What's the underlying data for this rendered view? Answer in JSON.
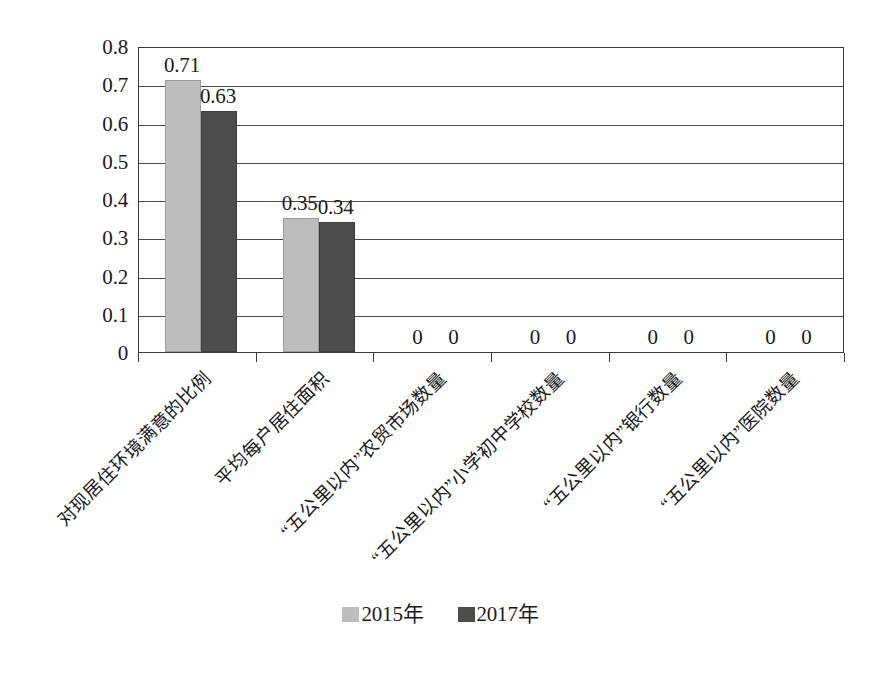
{
  "chart_data": {
    "type": "bar",
    "title": "",
    "subtitle": "",
    "xlabel": "",
    "ylabel": "",
    "ylim": [
      0,
      0.8
    ],
    "ytick_labels": [
      "0.8",
      "0.7",
      "0.6",
      "0.5",
      "0.4",
      "0.3",
      "0.2",
      "0.1",
      "0"
    ],
    "ytick_values": [
      0.8,
      0.7,
      0.6,
      0.5,
      0.4,
      0.3,
      0.2,
      0.1,
      0
    ],
    "grid": "horizontal",
    "legend_position": "bottom-center",
    "categories": [
      "对现居住环境满意的比例",
      "平均每户居住面积",
      "“五公里以内”农贸市场数量",
      "“五公里以内”小学初中学校数量",
      "“五公里以内”银行数量",
      "“五公里以内”医院数量"
    ],
    "series": [
      {
        "name": "2015年",
        "color": "#bdbdbd",
        "values": [
          0.71,
          0.35,
          0,
          0,
          0,
          0
        ],
        "value_labels": [
          "0.71",
          "0.35",
          "0",
          "0",
          "0",
          "0"
        ]
      },
      {
        "name": "2017年",
        "color": "#4c4c4c",
        "values": [
          0.63,
          0.34,
          0,
          0,
          0,
          0
        ],
        "value_labels": [
          "0.63",
          "0.34",
          "0",
          "0",
          "0",
          "0"
        ]
      }
    ]
  },
  "legend": {
    "entries": [
      {
        "label": "2015年",
        "swatch": "series0"
      },
      {
        "label": "2017年",
        "swatch": "series1"
      }
    ]
  },
  "axes": {
    "plot_border_color": "#3a3a3a",
    "gridline_color": "#4a4a4a"
  }
}
